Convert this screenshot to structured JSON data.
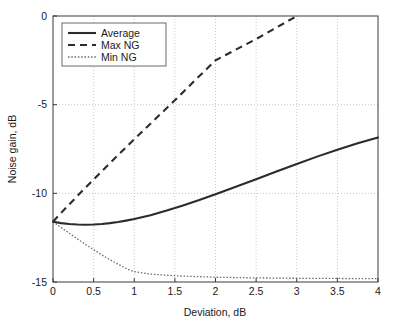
{
  "chart_data": {
    "type": "line",
    "title": "",
    "xlabel": "Deviation, dB",
    "ylabel": "Noise gain, dB",
    "xlim": [
      0,
      4
    ],
    "ylim": [
      -15,
      0
    ],
    "xticks": [
      "0",
      "0.5",
      "1",
      "1.5",
      "2",
      "2.5",
      "3",
      "3.5",
      "4"
    ],
    "xtick_values": [
      0,
      0.5,
      1,
      1.5,
      2,
      2.5,
      3,
      3.5,
      4
    ],
    "yticks": [
      "0",
      "-5",
      "-10",
      "-15"
    ],
    "ytick_values": [
      0,
      -5,
      -10,
      -15
    ],
    "grid": true,
    "grid_style": "dotted",
    "legend_position": "upper-left",
    "series": [
      {
        "name": "Average",
        "style": "solid",
        "color": "#2b2b2b",
        "x": [
          0,
          0.1,
          0.2,
          0.3,
          0.4,
          0.5,
          0.6,
          0.7,
          0.8,
          0.9,
          1.0,
          1.2,
          1.4,
          1.6,
          1.8,
          2.0,
          2.25,
          2.5,
          2.75,
          3.0,
          3.25,
          3.5,
          3.75,
          4.0
        ],
        "y": [
          -11.6,
          -11.68,
          -11.73,
          -11.76,
          -11.77,
          -11.76,
          -11.73,
          -11.68,
          -11.62,
          -11.54,
          -11.45,
          -11.23,
          -10.97,
          -10.68,
          -10.38,
          -10.05,
          -9.63,
          -9.2,
          -8.77,
          -8.34,
          -7.93,
          -7.54,
          -7.18,
          -6.85
        ]
      },
      {
        "name": "Max NG",
        "style": "dashed",
        "color": "#2b2b2b",
        "x": [
          0,
          0.1,
          0.2,
          0.3,
          0.4,
          0.5,
          0.6,
          0.7,
          0.8,
          0.9,
          1.0,
          1.25,
          1.5,
          1.75,
          2.0,
          2.25,
          2.5,
          2.75,
          3.0
        ],
        "y": [
          -11.6,
          -11.1,
          -10.62,
          -10.15,
          -9.68,
          -9.22,
          -8.76,
          -8.3,
          -7.85,
          -7.4,
          -6.95,
          -5.85,
          -4.75,
          -3.62,
          -2.5,
          -1.9,
          -1.3,
          -0.65,
          0.0
        ]
      },
      {
        "name": "Min NG",
        "style": "dotted",
        "color": "#6b6b6b",
        "x": [
          0,
          0.1,
          0.2,
          0.3,
          0.4,
          0.5,
          0.6,
          0.7,
          0.8,
          0.9,
          1.0,
          1.2,
          1.4,
          1.6,
          1.8,
          2.0,
          2.25,
          2.5,
          2.75,
          3.0,
          3.25,
          3.5,
          3.75,
          4.0
        ],
        "y": [
          -11.6,
          -11.93,
          -12.25,
          -12.57,
          -12.88,
          -13.18,
          -13.47,
          -13.74,
          -14.0,
          -14.24,
          -14.42,
          -14.55,
          -14.62,
          -14.67,
          -14.7,
          -14.73,
          -14.75,
          -14.77,
          -14.78,
          -14.79,
          -14.8,
          -14.8,
          -14.81,
          -14.81
        ]
      }
    ],
    "legend": [
      {
        "label": "Average",
        "style": "solid"
      },
      {
        "label": "Max NG",
        "style": "dashed"
      },
      {
        "label": "Min NG",
        "style": "dotted"
      }
    ]
  }
}
